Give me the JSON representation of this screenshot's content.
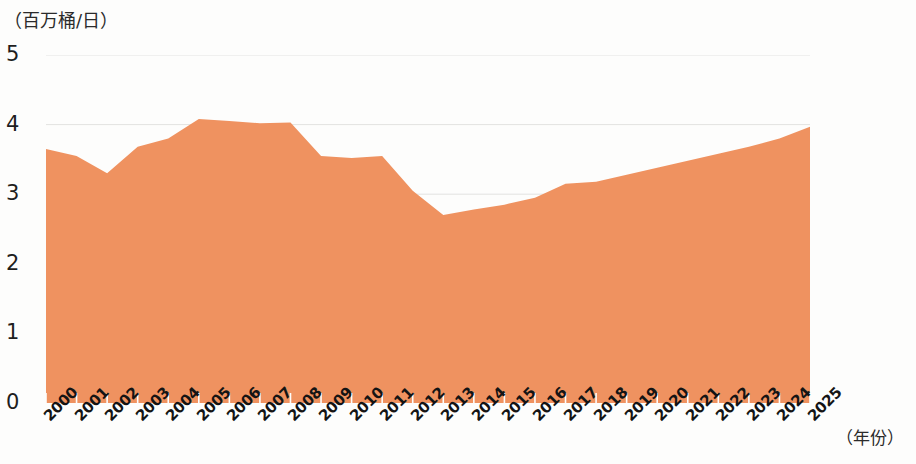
{
  "axes": {
    "y_unit_label": "（百万桶/日）",
    "x_unit_label": "（年份）",
    "y_ticks": [
      "5",
      "4",
      "3",
      "2",
      "1",
      "0"
    ]
  },
  "style": {
    "area_color": "#ef9260",
    "gridline_color": "#e3e3e1",
    "background": "#fdfdfc",
    "tick_text_color": "#141414"
  },
  "chart_data": {
    "type": "area",
    "title": "",
    "subtitle": "",
    "xlabel": "（年份）",
    "ylabel": "（百万桶/日）",
    "ylim": [
      0,
      5
    ],
    "grid": true,
    "legend": "none",
    "categories": [
      "2000",
      "2001",
      "2002",
      "2003",
      "2004",
      "2005",
      "2006",
      "2007",
      "2008",
      "2009",
      "2010",
      "2011",
      "2012",
      "2013",
      "2014",
      "2015",
      "2016",
      "2017",
      "2018",
      "2019",
      "2020",
      "2021",
      "2022",
      "2023",
      "2024",
      "2025"
    ],
    "values": [
      3.65,
      3.55,
      3.3,
      3.68,
      3.8,
      4.08,
      4.05,
      4.02,
      4.03,
      3.55,
      3.52,
      3.55,
      3.05,
      2.7,
      2.78,
      2.85,
      2.95,
      3.15,
      3.18,
      3.28,
      3.38,
      3.48,
      3.58,
      3.68,
      3.8,
      3.97
    ],
    "series": [
      {
        "name": "",
        "values": [
          3.65,
          3.55,
          3.3,
          3.68,
          3.8,
          4.08,
          4.05,
          4.02,
          4.03,
          3.55,
          3.52,
          3.55,
          3.05,
          2.7,
          2.78,
          2.85,
          2.95,
          3.15,
          3.18,
          3.28,
          3.38,
          3.48,
          3.58,
          3.68,
          3.8,
          3.97
        ]
      }
    ],
    "ytick_values": [
      5,
      4,
      3,
      2,
      1,
      0
    ]
  }
}
